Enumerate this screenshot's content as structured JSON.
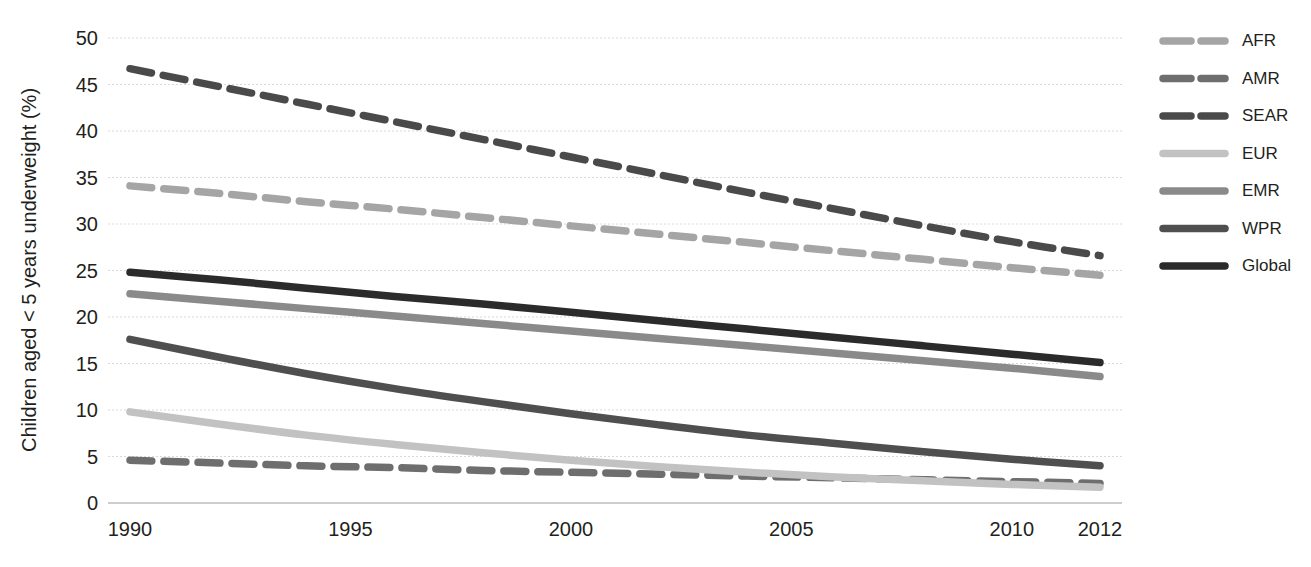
{
  "chart_data": {
    "type": "line",
    "title": "",
    "xlabel": "",
    "ylabel": "Children aged < 5 years underweight (%)",
    "xlim": [
      1990,
      2012
    ],
    "ylim": [
      0,
      50
    ],
    "grid": true,
    "legend_position": "right",
    "x_ticks": [
      "1990",
      "1995",
      "2000",
      "2005",
      "2010",
      "2012"
    ],
    "x_tick_values": [
      1990,
      1995,
      2000,
      2005,
      2010,
      2012
    ],
    "y_ticks": [
      "0",
      "5",
      "10",
      "15",
      "20",
      "25",
      "30",
      "35",
      "40",
      "45",
      "50"
    ],
    "y_tick_values": [
      0,
      5,
      10,
      15,
      20,
      25,
      30,
      35,
      40,
      45,
      50
    ],
    "x": [
      1990,
      1992,
      1994,
      1996,
      1998,
      2000,
      2002,
      2004,
      2006,
      2008,
      2010,
      2012
    ],
    "series": [
      {
        "name": "AFR",
        "style": "dashed",
        "color": "#a5a5a5",
        "values": [
          34.1,
          33.3,
          32.4,
          31.6,
          30.7,
          29.8,
          28.9,
          28.0,
          27.1,
          26.2,
          25.3,
          24.5
        ]
      },
      {
        "name": "AMR",
        "style": "dashed",
        "color": "#6e6e6e",
        "values": [
          4.6,
          4.3,
          4.0,
          3.8,
          3.5,
          3.3,
          3.1,
          2.9,
          2.7,
          2.5,
          2.3,
          2.1
        ]
      },
      {
        "name": "SEAR",
        "style": "dashed",
        "color": "#4a4a4a",
        "values": [
          46.7,
          44.8,
          42.9,
          41.0,
          39.1,
          37.2,
          35.3,
          33.4,
          31.6,
          29.8,
          28.1,
          26.6
        ]
      },
      {
        "name": "EUR",
        "style": "solid",
        "color": "#c2c2c2",
        "values": [
          9.8,
          8.5,
          7.3,
          6.3,
          5.4,
          4.6,
          3.9,
          3.3,
          2.8,
          2.4,
          2.0,
          1.7
        ]
      },
      {
        "name": "EMR",
        "style": "solid",
        "color": "#8a8a8a",
        "values": [
          22.5,
          21.7,
          20.9,
          20.1,
          19.3,
          18.5,
          17.7,
          16.9,
          16.1,
          15.3,
          14.5,
          13.6
        ]
      },
      {
        "name": "WPR",
        "style": "solid",
        "color": "#4f4f4f",
        "values": [
          17.6,
          15.7,
          13.9,
          12.3,
          10.9,
          9.6,
          8.4,
          7.3,
          6.4,
          5.5,
          4.7,
          4.0
        ]
      },
      {
        "name": "Global",
        "style": "solid",
        "color": "#2b2b2b",
        "values": [
          24.8,
          24.0,
          23.1,
          22.2,
          21.4,
          20.5,
          19.6,
          18.7,
          17.8,
          16.9,
          16.0,
          15.1
        ]
      }
    ]
  },
  "legend": {
    "items": [
      {
        "label": "AFR",
        "color": "#a5a5a5",
        "style": "dashed"
      },
      {
        "label": "AMR",
        "color": "#6e6e6e",
        "style": "dashed"
      },
      {
        "label": "SEAR",
        "color": "#4a4a4a",
        "style": "dashed"
      },
      {
        "label": "EUR",
        "color": "#c2c2c2",
        "style": "solid"
      },
      {
        "label": "EMR",
        "color": "#8a8a8a",
        "style": "solid"
      },
      {
        "label": "WPR",
        "color": "#4f4f4f",
        "style": "solid"
      },
      {
        "label": "Global",
        "color": "#2b2b2b",
        "style": "solid"
      }
    ]
  },
  "axis": {
    "y_title": "Children aged < 5 years underweight (%)"
  },
  "colors": {
    "background": "#ffffff",
    "text": "#231f20",
    "gridline": "#d9d9d9",
    "axisline": "#bdbdbd"
  }
}
